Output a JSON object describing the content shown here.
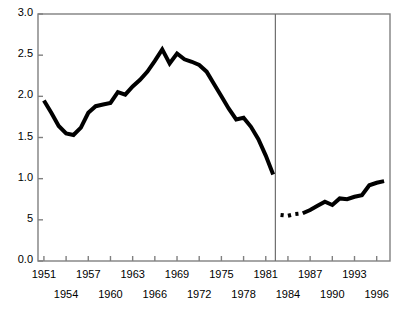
{
  "chart_data": {
    "type": "line",
    "title": "",
    "subtitle": "",
    "xlabel": "",
    "ylabel": "",
    "xlim": [
      1950.2,
      1997.8
    ],
    "ylim": [
      0.0,
      3.0
    ],
    "grid": false,
    "legend": "none",
    "y_ticks": [
      {
        "value": 3.0,
        "label": "3.0"
      },
      {
        "value": 2.5,
        "label": "2.5"
      },
      {
        "value": 2.0,
        "label": "2.0"
      },
      {
        "value": 1.5,
        "label": "1.5"
      },
      {
        "value": 1.0,
        "label": "1.0"
      },
      {
        "value": 0.5,
        "label": "5"
      },
      {
        "value": 0.0,
        "label": "0.0"
      }
    ],
    "x_ticks": [
      {
        "value": 1951,
        "label": "1951",
        "row": 0
      },
      {
        "value": 1954,
        "label": "1954",
        "row": 1
      },
      {
        "value": 1957,
        "label": "1957",
        "row": 0
      },
      {
        "value": 1960,
        "label": "1960",
        "row": 1
      },
      {
        "value": 1963,
        "label": "1963",
        "row": 0
      },
      {
        "value": 1966,
        "label": "1966",
        "row": 1
      },
      {
        "value": 1969,
        "label": "1969",
        "row": 0
      },
      {
        "value": 1972,
        "label": "1972",
        "row": 1
      },
      {
        "value": 1975,
        "label": "1975",
        "row": 0
      },
      {
        "value": 1978,
        "label": "1978",
        "row": 1
      },
      {
        "value": 1981,
        "label": "1981",
        "row": 0
      },
      {
        "value": 1984,
        "label": "1984",
        "row": 1
      },
      {
        "value": 1987,
        "label": "1987",
        "row": 0
      },
      {
        "value": 1990,
        "label": "1990",
        "row": 1
      },
      {
        "value": 1993,
        "label": "1993",
        "row": 0
      },
      {
        "value": 1996,
        "label": "1996",
        "row": 1
      }
    ],
    "annotations": [
      {
        "name": "series-break-divider",
        "type": "vline",
        "x": 1982.3,
        "label": ""
      }
    ],
    "series": [
      {
        "name": "series-1",
        "style": "solid",
        "color": "#000000",
        "x": [
          1951,
          1952,
          1953,
          1954,
          1955,
          1956,
          1957,
          1958,
          1959,
          1960,
          1961,
          1962,
          1963,
          1964,
          1965,
          1966,
          1967,
          1968,
          1969,
          1970,
          1971,
          1972,
          1973,
          1974,
          1975,
          1976,
          1977,
          1978,
          1979,
          1980,
          1981,
          1982
        ],
        "values": [
          1.95,
          1.8,
          1.64,
          1.55,
          1.53,
          1.62,
          1.8,
          1.88,
          1.9,
          1.92,
          2.05,
          2.02,
          2.12,
          2.2,
          2.3,
          2.43,
          2.57,
          2.4,
          2.52,
          2.45,
          2.42,
          2.38,
          2.3,
          2.15,
          2.0,
          1.85,
          1.72,
          1.74,
          1.63,
          1.48,
          1.28,
          1.05
        ]
      },
      {
        "name": "series-2",
        "style": "solid-with-gaps",
        "color": "#000000",
        "x": [
          1983,
          1984,
          1985,
          1986,
          1987,
          1988,
          1989,
          1990,
          1991,
          1992,
          1993,
          1994,
          1995,
          1996,
          1997
        ],
        "values": [
          0.56,
          0.55,
          0.57,
          0.58,
          0.62,
          0.67,
          0.72,
          0.68,
          0.76,
          0.75,
          0.78,
          0.8,
          0.92,
          0.95,
          0.97
        ],
        "gaps": [
          [
            1983,
            1984
          ],
          [
            1984,
            1985
          ],
          [
            1985,
            1986
          ]
        ]
      }
    ]
  },
  "axes": {
    "frame_color": "#808080",
    "line_color": "#000000",
    "line_width": 4
  }
}
